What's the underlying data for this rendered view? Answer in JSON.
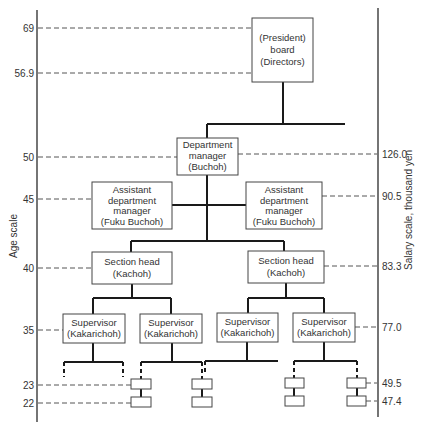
{
  "axes": {
    "left_label": "Age scale",
    "right_label": "Salary scale, thousand yen",
    "left_ticks": [
      {
        "label": "69",
        "y": 28
      },
      {
        "label": "56.9",
        "y": 73
      },
      {
        "label": "50",
        "y": 157
      },
      {
        "label": "45",
        "y": 199
      },
      {
        "label": "40",
        "y": 268
      },
      {
        "label": "35",
        "y": 330
      },
      {
        "label": "23",
        "y": 385
      },
      {
        "label": "22",
        "y": 403
      }
    ],
    "right_ticks": [
      {
        "label": "126.0",
        "y": 154
      },
      {
        "label": "90.5",
        "y": 196
      },
      {
        "label": "83.3",
        "y": 266
      },
      {
        "label": "77.0",
        "y": 327
      },
      {
        "label": "49.5",
        "y": 383
      },
      {
        "label": "47.4",
        "y": 401
      }
    ]
  },
  "nodes": [
    {
      "id": "president",
      "lines": [
        "(President)",
        "board",
        "(Directors)"
      ],
      "x": 252,
      "y": 18,
      "w": 61,
      "h": 64
    },
    {
      "id": "dept-manager",
      "lines": [
        "Department",
        "manager",
        "(Buchoh)"
      ],
      "x": 177,
      "y": 138,
      "w": 61,
      "h": 37
    },
    {
      "id": "asst-dept-manager-left",
      "lines": [
        "Assistant",
        "department",
        "manager",
        "(Fuku Buchoh)"
      ],
      "x": 92,
      "y": 182,
      "w": 80,
      "h": 47
    },
    {
      "id": "asst-dept-manager-right",
      "lines": [
        "Assistant",
        "department",
        "manager",
        "(Fuku Buchoh)"
      ],
      "x": 246,
      "y": 182,
      "w": 76,
      "h": 47
    },
    {
      "id": "section-head-left",
      "lines": [
        "Section head",
        "(Kachoh)"
      ],
      "x": 92,
      "y": 252,
      "w": 80,
      "h": 32
    },
    {
      "id": "section-head-right",
      "lines": [
        "Section head",
        "(Kachoh)"
      ],
      "x": 248,
      "y": 251,
      "w": 76,
      "h": 32
    },
    {
      "id": "supervisor-1",
      "lines": [
        "Supervisor",
        "(Kakarichoh)"
      ],
      "x": 63,
      "y": 314,
      "w": 62,
      "h": 29
    },
    {
      "id": "supervisor-2",
      "lines": [
        "Supervisor",
        "(Kakarichoh)"
      ],
      "x": 140,
      "y": 314,
      "w": 62,
      "h": 29
    },
    {
      "id": "supervisor-3",
      "lines": [
        "Supervisor",
        "(Kakarichoh)"
      ],
      "x": 217,
      "y": 313,
      "w": 61,
      "h": 29
    },
    {
      "id": "supervisor-4",
      "lines": [
        "Supervisor",
        "(Kakarichoh)"
      ],
      "x": 293,
      "y": 313,
      "w": 62,
      "h": 29
    }
  ],
  "small_boxes": [
    {
      "x": 131,
      "y": 379,
      "w": 20,
      "h": 10
    },
    {
      "x": 131,
      "y": 397,
      "w": 20,
      "h": 10
    },
    {
      "x": 192,
      "y": 379,
      "w": 20,
      "h": 10
    },
    {
      "x": 192,
      "y": 397,
      "w": 20,
      "h": 10
    },
    {
      "x": 285,
      "y": 378,
      "w": 19,
      "h": 10
    },
    {
      "x": 285,
      "y": 396,
      "w": 19,
      "h": 10
    },
    {
      "x": 347,
      "y": 378,
      "w": 19,
      "h": 10
    },
    {
      "x": 347,
      "y": 396,
      "w": 19,
      "h": 10
    }
  ]
}
